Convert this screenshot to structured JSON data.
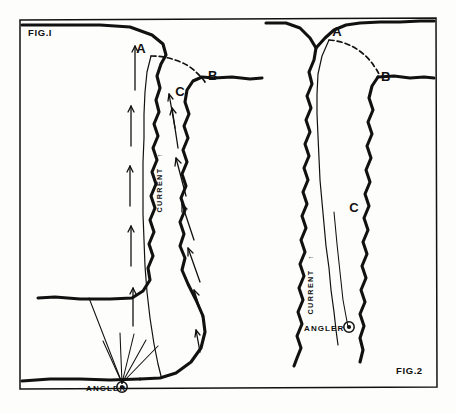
{
  "figure": {
    "title_fig1": "FIG.I",
    "title_fig2": "FIG.2",
    "background_color": "#fdfdfb",
    "ink_color": "#111111"
  },
  "fig1": {
    "label": "FIG.I",
    "point_a": "A",
    "point_b": "B",
    "point_c": "C",
    "current_label": "CURRENT",
    "current_arrow": "↑",
    "angler_label": "ANGLER",
    "angler_marker": "circled-dot"
  },
  "fig2": {
    "label": "FIG.2",
    "point_a": "A",
    "point_b": "B",
    "point_c": "C",
    "current_label": "CURRENT",
    "current_arrow": "↑",
    "angler_label": "ANGLER",
    "angler_marker": "circled-dot"
  }
}
